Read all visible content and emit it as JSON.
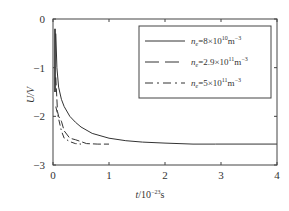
{
  "chart_data": {
    "type": "line",
    "title": "",
    "xlabel": "t/10^-23 s",
    "ylabel": "U/V",
    "xlim": [
      0,
      4
    ],
    "ylim": [
      -3,
      0
    ],
    "x_ticks": [
      0,
      1,
      2,
      3,
      4
    ],
    "y_ticks": [
      0,
      -1,
      -2,
      -3
    ],
    "x_tick_labels": [
      "0",
      "1",
      "2",
      "3",
      "4"
    ],
    "y_tick_labels": [
      "0",
      "-1",
      "-2",
      "-3"
    ],
    "grid": false,
    "legend_position": "upper right",
    "series": [
      {
        "name": "n_e=8×10^10 m^-3",
        "style": "solid",
        "x": [
          0.05,
          0.07,
          0.1,
          0.15,
          0.2,
          0.3,
          0.4,
          0.5,
          0.7,
          1.0,
          1.3,
          1.6,
          2.0,
          2.5,
          2.9
        ],
        "y": [
          -0.3,
          -1.0,
          -1.4,
          -1.65,
          -1.8,
          -2.0,
          -2.12,
          -2.22,
          -2.35,
          -2.45,
          -2.5,
          -2.53,
          -2.55,
          -2.57,
          -2.57
        ]
      },
      {
        "name": "n_e=2.9×10^11 m^-3",
        "style": "dashed",
        "x": [
          0.05,
          0.08,
          0.1,
          0.15,
          0.2,
          0.3,
          0.4,
          0.5,
          0.6,
          0.8,
          1.0
        ],
        "y": [
          -1.2,
          -1.9,
          -2.0,
          -2.1,
          -2.3,
          -2.45,
          -2.48,
          -2.52,
          -2.56,
          -2.57,
          -2.57
        ]
      },
      {
        "name": "n_e=5×10^11 m^-3",
        "style": "dashdot",
        "x": [
          0.05,
          0.08,
          0.1,
          0.15,
          0.2,
          0.3,
          0.4,
          0.5
        ],
        "y": [
          -1.8,
          -1.95,
          -2.05,
          -2.3,
          -2.45,
          -2.52,
          -2.56,
          -2.57
        ]
      }
    ],
    "legend_entries": [
      {
        "prefix": "n",
        "sub": "e",
        "text": "=8×10",
        "exp": "10",
        "unit": "m",
        "unit_exp": "-3"
      },
      {
        "prefix": "n",
        "sub": "e",
        "text": "=2.9×10",
        "exp": "11",
        "unit": "m",
        "unit_exp": "-3"
      },
      {
        "prefix": "n",
        "sub": "e",
        "text": "=5×10",
        "exp": "11",
        "unit": "m",
        "unit_exp": "-3"
      }
    ],
    "baseline": -2.57
  },
  "axes": {
    "ylabel": "U/V",
    "xlabel_main": "t",
    "xlabel_rest": "/10",
    "xlabel_exp": "-23",
    "xlabel_unit": "s"
  },
  "colors": {
    "line": "#333333",
    "axis": "#444444"
  }
}
